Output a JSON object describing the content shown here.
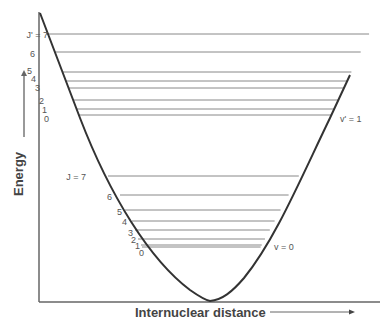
{
  "diagram": {
    "y_axis_label": "Energy",
    "x_axis_label": "Internuclear distance",
    "upper_band": {
      "label": "v' = 1",
      "j_prefix": "J' = ",
      "levels": [
        {
          "j": "7",
          "y": 34,
          "label_x": 44,
          "label_y": 38,
          "x_start": 46
        },
        {
          "j": "6",
          "y": 52,
          "label_x": 30,
          "label_y": 57,
          "x_start": 55
        },
        {
          "j": "5",
          "y": 72,
          "label_x": 27,
          "label_y": 74,
          "x_start": 63
        },
        {
          "j": "4",
          "y": 81,
          "label_x": 31,
          "label_y": 82,
          "x_start": 66
        },
        {
          "j": "3",
          "y": 88,
          "label_x": 35,
          "label_y": 91,
          "x_start": 68
        },
        {
          "j": "2",
          "y": 100,
          "label_x": 39,
          "label_y": 104,
          "x_start": 73
        },
        {
          "j": "1",
          "y": 109,
          "label_x": 42,
          "label_y": 113,
          "x_start": 76
        },
        {
          "j": "0",
          "y": 115,
          "label_x": 44,
          "label_y": 122,
          "x_start": 78
        }
      ],
      "band_label_x": 340,
      "band_label_y": 122
    },
    "lower_band": {
      "label": "v = 0",
      "j_prefix": "J = ",
      "levels": [
        {
          "j": "7",
          "y": 176,
          "label_x": 82,
          "label_y": 180,
          "x_start": 108
        },
        {
          "j": "6",
          "y": 195,
          "label_x": 107,
          "label_y": 200,
          "x_start": 120
        },
        {
          "j": "5",
          "y": 210,
          "label_x": 117,
          "label_y": 215,
          "x_start": 125
        },
        {
          "j": "4",
          "y": 221,
          "label_x": 122,
          "label_y": 225,
          "x_start": 132
        },
        {
          "j": "3",
          "y": 230,
          "label_x": 128,
          "label_y": 236,
          "x_start": 135
        },
        {
          "j": "2",
          "y": 239,
          "label_x": 131,
          "label_y": 243,
          "x_start": 138
        },
        {
          "j": "1",
          "y": 245,
          "label_x": 135,
          "label_y": 249,
          "x_start": 141
        },
        {
          "j": "0",
          "y": 247,
          "label_x": 139,
          "label_y": 256,
          "x_start": 142
        }
      ],
      "band_label_x": 274,
      "band_label_y": 250
    }
  }
}
